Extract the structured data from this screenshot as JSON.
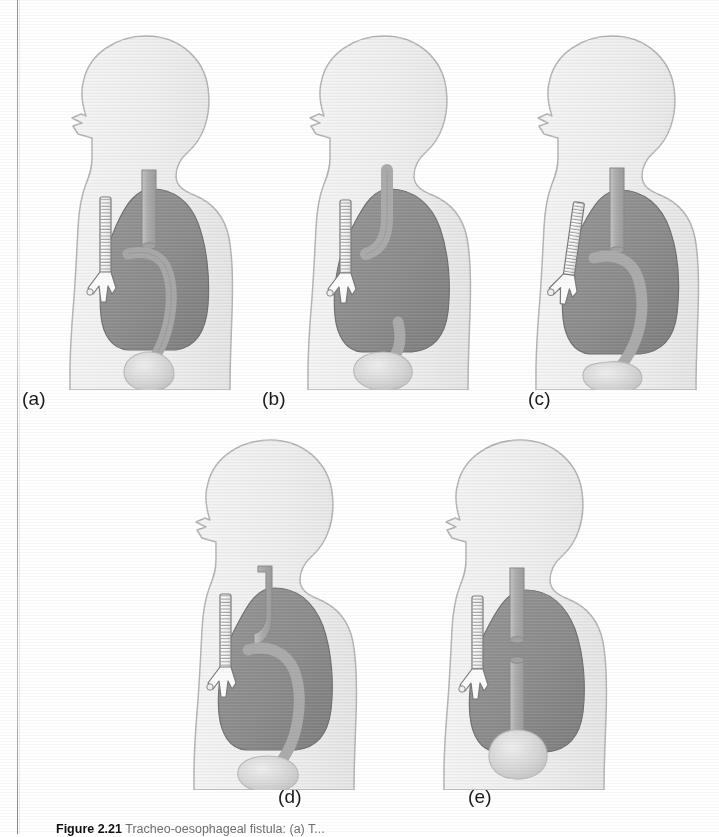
{
  "figure": {
    "number": "Figure 2.21",
    "caption_text": "Tracheo-oesophageal fistula: (a) T...",
    "panel_labels": [
      "(a)",
      "(b)",
      "(c)",
      "(d)",
      "(e)"
    ]
  },
  "colors": {
    "page_background": "#ffffff",
    "body_fill": "#ededed",
    "body_fill_shade": "#e2e2e2",
    "body_outline": "#b4b4b4",
    "lung_fill": "#8c8c8c",
    "lung_fill_dark": "#7e7e7e",
    "lung_outline": "#6f6f6f",
    "tube_fill": "#b0b0b0",
    "tube_outline": "#8e8e8e",
    "stomach_fill": "#d2d2d2",
    "trachea_fill": "#fbfbfb",
    "trachea_outline": "#7a7a7a",
    "label_text": "#1a1a1a",
    "scan_edge": "#7d7d7d"
  },
  "panels": [
    {
      "id": "a",
      "label": "(a)",
      "anatomy": {
        "body": "lateral head neck and upper torso silhouette",
        "lungs": "dark grey lung field filling the thorax",
        "trachea": "white ribbed trachea bifurcating into two bronchi",
        "upper_tube": "grey oesophageal segment descending from neck, ending blind in mid chest",
        "lower_tube": "grey oesophageal segment curving down to the stomach",
        "stomach": "pale bulbous stomach below the diaphragm"
      },
      "variant": "blind upper pouch with separate lower segment curving to stomach"
    },
    {
      "id": "b",
      "label": "(b)",
      "anatomy": {
        "body": "lateral head neck and upper torso silhouette",
        "lungs": "dark grey lung field filling the thorax",
        "trachea": "white ribbed trachea bifurcating into two bronchi",
        "upper_tube": "grey oesophageal segment curving forward to join the trachea",
        "lower_tube": "not continuous with upper segment",
        "stomach": "pale bulbous stomach below the diaphragm"
      },
      "variant": "upper segment communicating with trachea"
    },
    {
      "id": "c",
      "label": "(c)",
      "anatomy": {
        "body": "lateral head neck and upper torso silhouette",
        "lungs": "dark grey lung field filling the thorax",
        "trachea": "white ribbed trachea angled, bifurcating into two bronchi",
        "upper_tube": "grey oesophageal segment descending and ending in mid chest",
        "lower_tube": "grey oesophageal segment arching down to the stomach",
        "stomach": "pale bulbous stomach below the diaphragm"
      },
      "variant": "blind upper pouch with lower fistula arching to stomach"
    },
    {
      "id": "d",
      "label": "(d)",
      "anatomy": {
        "body": "lateral head neck and upper torso silhouette",
        "lungs": "dark grey lung field filling the thorax",
        "trachea": "white ribbed trachea bifurcating into two bronchi",
        "upper_tube": "grey oesophageal segment descending from neck",
        "lower_tube": "grey oesophageal segment continuing down to the stomach",
        "stomach": "pale bulbous stomach below the diaphragm"
      },
      "variant": "H-type connection between oesophagus and trachea"
    },
    {
      "id": "e",
      "label": "(e)",
      "anatomy": {
        "body": "lateral head neck and upper torso silhouette",
        "lungs": "dark grey lung field filling the thorax",
        "trachea": "white ribbed trachea bifurcating into two bronchi",
        "upper_tube": "short grey upper oesophageal pouch ending blind",
        "lower_tube": "separate straight grey lower oesophagus running to the stomach",
        "stomach": "pale bulbous stomach below the diaphragm"
      },
      "variant": "pure atresia, separate blind upper pouch and lower oesophagus"
    }
  ]
}
